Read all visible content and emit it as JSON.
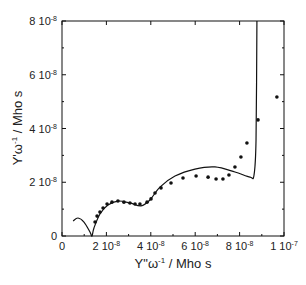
{
  "chart_data": {
    "type": "scatter",
    "title": "",
    "xlabel": "Y\"ω-1 / Mho s",
    "ylabel": "Y'ω-1 / Mho s",
    "xlim": [
      0,
      1e-07
    ],
    "ylim": [
      0,
      8e-08
    ],
    "grid": false,
    "legend": null,
    "x_ticks": [
      {
        "value": 0,
        "label": "0"
      },
      {
        "value": 2e-08,
        "label_mantissa": "2 10",
        "label_exp": "-8"
      },
      {
        "value": 4e-08,
        "label_mantissa": "4 10",
        "label_exp": "-8"
      },
      {
        "value": 6e-08,
        "label_mantissa": "6 10",
        "label_exp": "-8"
      },
      {
        "value": 8e-08,
        "label_mantissa": "8 10",
        "label_exp": "-8"
      },
      {
        "value": 1e-07,
        "label_mantissa": "1 10",
        "label_exp": "-7"
      }
    ],
    "y_ticks": [
      {
        "value": 0,
        "label": "0"
      },
      {
        "value": 2e-08,
        "label_mantissa": "2 10",
        "label_exp": "-8"
      },
      {
        "value": 4e-08,
        "label_mantissa": "4 10",
        "label_exp": "-8"
      },
      {
        "value": 6e-08,
        "label_mantissa": "6 10",
        "label_exp": "-8"
      },
      {
        "value": 8e-08,
        "label_mantissa": "8 10",
        "label_exp": "-8"
      }
    ],
    "units_scale": 1e-08,
    "series": [
      {
        "name": "experimental",
        "style": "markers",
        "x": [
          1.49,
          1.58,
          1.71,
          1.85,
          2.03,
          2.25,
          2.52,
          2.79,
          3.06,
          3.29,
          3.51,
          3.83,
          4.01,
          4.19,
          4.46,
          4.91,
          5.45,
          6.04,
          6.58,
          6.94,
          7.25,
          7.52,
          7.79,
          8.06,
          8.33,
          8.83,
          9.68
        ],
        "y": [
          0.52,
          0.74,
          0.89,
          1.04,
          1.19,
          1.26,
          1.3,
          1.26,
          1.23,
          1.19,
          1.19,
          1.26,
          1.38,
          1.6,
          1.79,
          1.97,
          2.16,
          2.23,
          2.19,
          2.12,
          2.12,
          2.27,
          2.57,
          2.94,
          3.46,
          4.32,
          5.17
        ]
      },
      {
        "name": "fit",
        "style": "line",
        "x": [
          0.5,
          0.72,
          0.99,
          1.26,
          1.35,
          1.44,
          1.71,
          2.07,
          2.52,
          3.06,
          3.56,
          3.96,
          4.41,
          5.09,
          5.99,
          6.89,
          7.79,
          8.47,
          8.65,
          8.74,
          8.78
        ],
        "y": [
          0.56,
          0.67,
          0.52,
          0.15,
          0.0,
          0.3,
          0.82,
          1.15,
          1.3,
          1.23,
          1.12,
          1.34,
          1.82,
          2.23,
          2.49,
          2.57,
          2.38,
          2.19,
          2.27,
          3.57,
          8.0
        ]
      }
    ]
  },
  "labels": {
    "x_title_main": "Y\"ω",
    "x_title_exp": "-1",
    "x_title_unit": " / Mho s",
    "y_title_main": "Y'ω",
    "y_title_exp": "-1",
    "y_title_unit": " / Mho s"
  }
}
